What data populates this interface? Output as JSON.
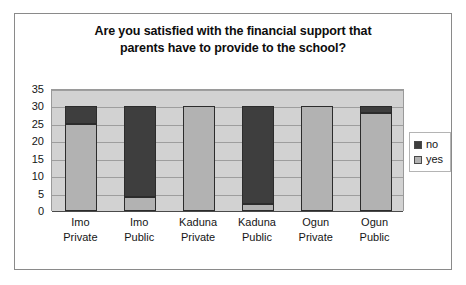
{
  "chart_data": {
    "type": "bar",
    "subtype": "stacked-column",
    "title": "Are you satisfied with the financial support that parents have to provide to the school?",
    "title_lines": [
      "Are you satisfied with the financial support that",
      "parents have to provide to the school?"
    ],
    "categories": [
      "Imo Private",
      "Imo Public",
      "Kaduna Private",
      "Kaduna Public",
      "Ogun Private",
      "Ogun Public"
    ],
    "category_lines": [
      [
        "Imo",
        "Private"
      ],
      [
        "Imo",
        "Public"
      ],
      [
        "Kaduna",
        "Private"
      ],
      [
        "Kaduna",
        "Public"
      ],
      [
        "Ogun",
        "Private"
      ],
      [
        "Ogun",
        "Public"
      ]
    ],
    "series": [
      {
        "name": "yes",
        "values": [
          25,
          4,
          30,
          2,
          30,
          28
        ],
        "color": "#b2b2b2"
      },
      {
        "name": "no",
        "values": [
          5,
          26,
          0,
          28,
          0,
          2
        ],
        "color": "#3e3e3e"
      }
    ],
    "stack_order": [
      "yes",
      "no"
    ],
    "xlabel": "",
    "ylabel": "",
    "ylim": [
      0,
      35
    ],
    "yticks": [
      0,
      5,
      10,
      15,
      20,
      25,
      30,
      35
    ],
    "ytick_labels": [
      "0",
      "5",
      "10",
      "15",
      "20",
      "25",
      "30",
      "35"
    ],
    "grid": true,
    "grid_axis": "y",
    "legend_position": "right",
    "legend_entries": [
      "no",
      "yes"
    ],
    "plot_background": "#d2d2d2",
    "chart_background": "#ffffff",
    "border_color": "#8a8a8a"
  }
}
